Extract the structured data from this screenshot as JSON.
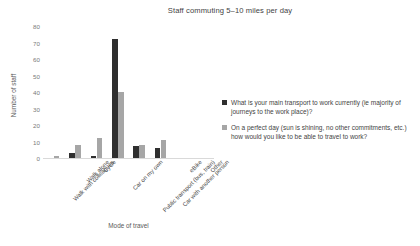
{
  "chart_data": {
    "type": "bar",
    "title": "Staff commuting 5–10 miles per day",
    "xlabel": "Mode of travel",
    "ylabel": "Number of staff",
    "ylim": [
      0,
      80
    ],
    "ytick_step": 10,
    "yticks": [
      0,
      10,
      20,
      30,
      40,
      50,
      60,
      70,
      80
    ],
    "grid": false,
    "legend_position": "right",
    "categories": [
      "Walk with colleagues",
      "Walk alone",
      "Cycle",
      "Car on my own",
      "Public transport (bus, train)",
      "Car with another person",
      "eBike",
      "Other"
    ],
    "series": [
      {
        "name": "What is your main transport to work currently (ie majority of journeys to the work place)?",
        "color": "#2f2f2f",
        "values": [
          0,
          3,
          1,
          72,
          7,
          6,
          0,
          0
        ]
      },
      {
        "name": "On a perfect day (sun is shining, no other commitments, etc.) how would you like to be able to travel to work?",
        "color": "#a6a6a6",
        "values": [
          1,
          8,
          12,
          40,
          8,
          11,
          0,
          0
        ]
      }
    ]
  },
  "legend": {
    "entries": [
      "What is your main transport to work currently (ie majority of journeys to the work place)?",
      "On a perfect day (sun is shining, no other commitments, etc.) how would you like to be able to travel to work?"
    ]
  }
}
